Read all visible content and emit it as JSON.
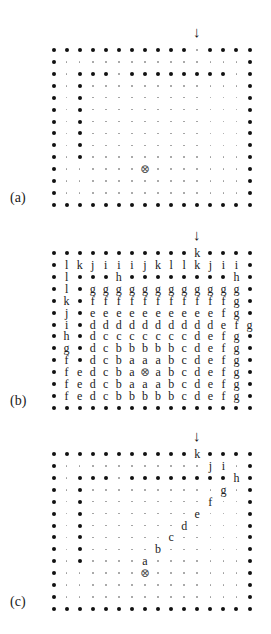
{
  "figure": {
    "grid_cols": 16,
    "grid_rows": 14,
    "legend": {
      "wall": "•",
      "open": "·",
      "target": "⊗",
      "entry_arrow": "↓"
    },
    "panels": [
      {
        "label": "(a)",
        "top": 44,
        "arrow_col": 11,
        "rows": [
          "WWWWWWWWWWW.WWWW",
          "W..............W",
          "W.WWW.WWWWWWWW.W",
          "W.W............W",
          "W.W............W",
          "W.W............W",
          "W.W............W",
          "W.W............W",
          "W.W............W",
          "W.W............W",
          "W......X.......W",
          "W..............W",
          "W..............W",
          "WWWWWWWWWWWWWWWW"
        ]
      },
      {
        "label": "(b)",
        "top": 247,
        "arrow_col": 11,
        "rows": [
          "WWWWWWWWWWWkWWWW",
          "WlkjiiijkllkjiiW",
          "WlWWWhWWWWWWWWhW",
          "WlWggggggggggggW",
          "WkWfffffffffffgW",
          "WjWeeeeeeeeeefgW",
          "WiWddddddddddefgW",
          "WhWdcccccccdefgW",
          "WgWdcbbbbbcdefgW",
          "WfWdcbaaabcdefgW",
          "WfedcbaXabcdefgW",
          "WfedcbaaabcdefgW",
          "WfedcbbbbbcdefgW",
          "WWWWWWWWWWWWWWWW"
        ]
      },
      {
        "label": "(c)",
        "top": 448,
        "arrow_col": 11,
        "rows": [
          "WWWWWWWWWWWkWWWW",
          "W...........ji.W",
          "W.WWW.WWWWWWWWhW",
          "W.W..........g.W",
          "W.W.........f..W",
          "W.W........e...W",
          "W.W.......d....W",
          "W.W......c.....W",
          "W.W.....b......W",
          "W.W....a.......W",
          "W......X.......W",
          "W..............W",
          "W..............W",
          "WWWWWWWWWWWWWWWW"
        ]
      }
    ]
  }
}
